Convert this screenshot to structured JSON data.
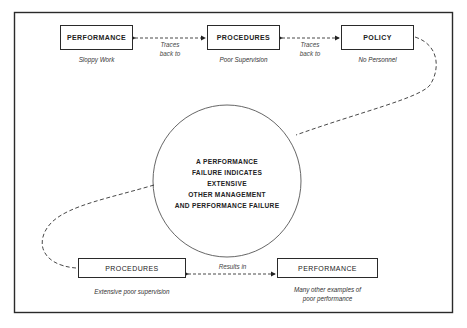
{
  "diagram": {
    "top_row": [
      {
        "label": "PERFORMANCE",
        "caption": "Sloppy Work"
      },
      {
        "label": "PROCEDURES",
        "caption": "Poor Supervision"
      },
      {
        "label": "POLICY",
        "caption": "No Personnel"
      }
    ],
    "connectors_top": [
      {
        "line1": "Traces",
        "line2": "back to"
      },
      {
        "line1": "Traces",
        "line2": "back to"
      }
    ],
    "center": {
      "lines": [
        "A PERFORMANCE",
        "FAILURE INDICATES",
        "EXTENSIVE",
        "OTHER MANAGEMENT",
        "AND PERFORMANCE FAILURE"
      ]
    },
    "bottom_row": [
      {
        "label": "PROCEDURES",
        "caption": "Extensive poor supervision"
      },
      {
        "label": "PERFORMANCE",
        "caption_line1": "Many other examples of",
        "caption_line2": "poor performance"
      }
    ],
    "connector_bottom": {
      "label": "Results in"
    }
  }
}
